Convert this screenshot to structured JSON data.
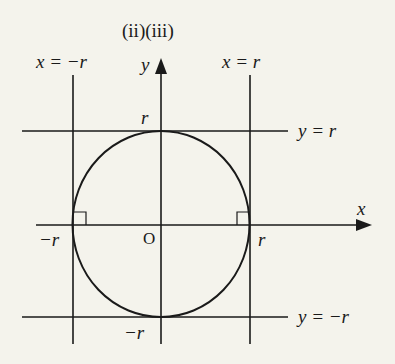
{
  "title": "(ii)(iii)",
  "labels": {
    "x_eq_neg_r": "x = −r",
    "x_eq_r": "x = r",
    "y_eq_r": "y = r",
    "y_eq_neg_r": "y = −r",
    "y_axis": "y",
    "x_axis": "x",
    "origin": "O",
    "r_top": "r",
    "neg_r_bottom": "−r",
    "neg_r_left": "−r",
    "r_right": "r"
  },
  "geometry": {
    "origin": [
      161,
      225
    ],
    "radius_px": 89,
    "stroke_color": "#1a1a1a",
    "background": "#f4f3ec"
  }
}
